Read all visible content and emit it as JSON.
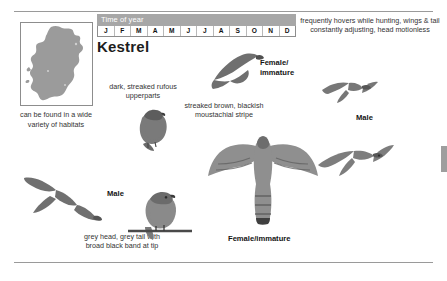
{
  "page": {
    "species_title": "Kestrel",
    "time_of_year": {
      "header": "Time of year",
      "months": [
        "J",
        "F",
        "M",
        "A",
        "M",
        "J",
        "J",
        "A",
        "S",
        "O",
        "N",
        "D"
      ]
    },
    "map": {
      "region": "Ireland",
      "caption": "can be found in a wide variety of habitats",
      "fill_color": "#9b9b9b",
      "border_color": "#8d8d8d"
    },
    "annotations": [
      {
        "id": "rufous-upperparts",
        "text": "dark, streaked rufous upperparts"
      },
      {
        "id": "moustachial-stripe",
        "text": "streaked brown, blackish moustachial stripe"
      },
      {
        "id": "hovering-behaviour",
        "text": "frequently hovers while hunting, wings & tail constantly adjusting, head motionless"
      },
      {
        "id": "grey-head-tail",
        "text": "grey head, grey tail with broad black band at tip"
      }
    ],
    "figure_labels": [
      {
        "id": "female-immature-flight-top",
        "text": "Female/ immature"
      },
      {
        "id": "male-flight-right",
        "text": "Male"
      },
      {
        "id": "male-flight-left",
        "text": "Male"
      },
      {
        "id": "female-immature-flight-large",
        "text": "Female/immature"
      }
    ],
    "colors": {
      "header_bar": "#a7a7a7",
      "header_text": "#ffffff",
      "rule": "#9a9a9a",
      "body_text": "#333333",
      "page_background": "#ffffff"
    }
  }
}
